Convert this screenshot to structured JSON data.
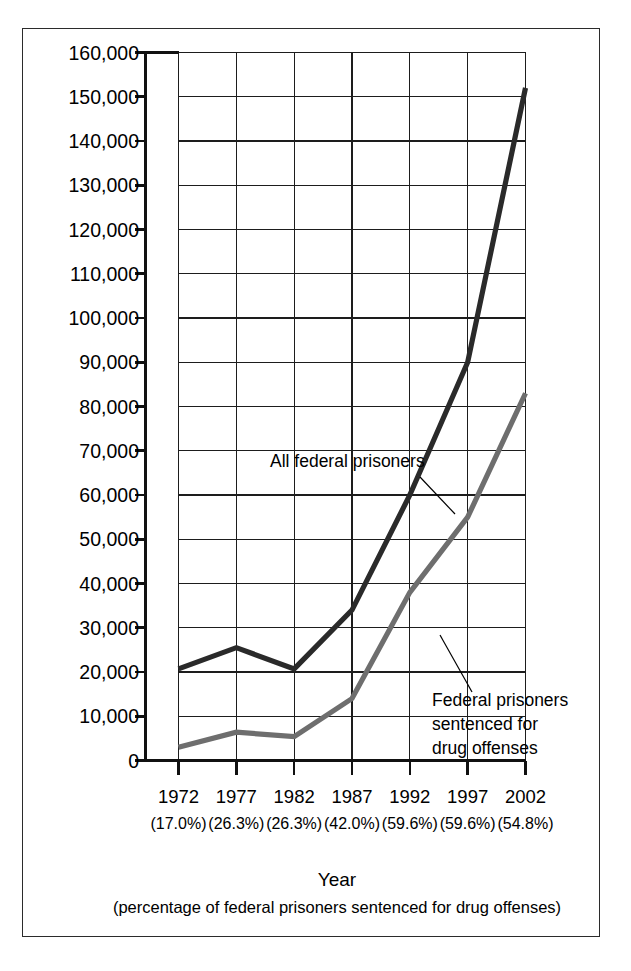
{
  "chart_data": {
    "type": "line",
    "title": "",
    "xlabel": "Year",
    "xlabel_sub": "(percentage of federal prisoners sentenced for drug offenses)",
    "ylabel": "",
    "categories": [
      "1972",
      "1977",
      "1982",
      "1987",
      "1992",
      "1997",
      "2002"
    ],
    "category_sublabels": [
      "(17.0%)",
      "(26.3%)",
      "(26.3%)",
      "(42.0%)",
      "(59.6%)",
      "(59.6%)",
      "(54.8%)"
    ],
    "ylim": [
      0,
      160000
    ],
    "ytick_values": [
      0,
      10000,
      20000,
      30000,
      40000,
      50000,
      60000,
      70000,
      80000,
      90000,
      100000,
      110000,
      120000,
      130000,
      140000,
      150000,
      160000
    ],
    "ytick_labels": [
      "0",
      "10,000",
      "20,000",
      "30,000",
      "40,000",
      "50,000",
      "60,000",
      "70,000",
      "80,000",
      "90,000",
      "100,000",
      "110,000",
      "120,000",
      "130,000",
      "140,000",
      "150,000",
      "160,000"
    ],
    "grid": true,
    "legend_position": "inline-annotations",
    "series": [
      {
        "name": "All federal prisoners",
        "color": "#2a2a2a",
        "stroke_width": 5.2,
        "values": [
          20700,
          25500,
          20700,
          34000,
          60000,
          90000,
          152000
        ]
      },
      {
        "name": "Federal prisoners sentenced for drug offenses",
        "color": "#6e6e6e",
        "stroke_width": 5.2,
        "values": [
          3000,
          6400,
          5400,
          14000,
          38000,
          55000,
          83000
        ]
      }
    ],
    "annotations": [
      {
        "id": "all-federal-prisoners",
        "lines": [
          "All federal prisoners"
        ],
        "text_x": 270,
        "text_y": 467,
        "leader": [
          [
            420,
            477
          ],
          [
            455,
            514
          ]
        ]
      },
      {
        "id": "drug-offense-prisoners",
        "lines": [
          "Federal prisoners",
          "sentenced for",
          "drug offenses"
        ],
        "text_x": 432,
        "text_y": 706,
        "leader": [
          [
            440,
            635
          ],
          [
            472,
            692
          ]
        ]
      }
    ]
  },
  "colors": {
    "all_prisoners": "#2a2a2a",
    "drug_prisoners": "#6e6e6e",
    "grid": "#1d1d1d",
    "axis": "#111111",
    "frame": "#2b2b2b",
    "background": "#ffffff"
  }
}
